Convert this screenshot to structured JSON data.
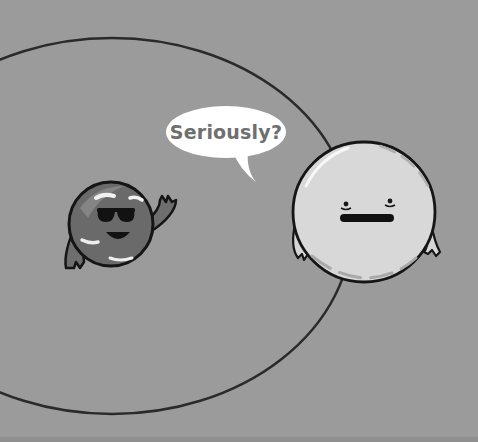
{
  "scene": {
    "title": "Planet comic panel",
    "background_color": "#9b9b9b",
    "speech_bubble": {
      "text": "Seriously?",
      "speaker": "large-planet"
    },
    "characters": [
      {
        "name": "small-planet",
        "expression": "smiling with sunglasses, waving"
      },
      {
        "name": "large-planet",
        "expression": "unimpressed flat mouth"
      }
    ],
    "orbit": {
      "shape": "ellipse"
    }
  }
}
